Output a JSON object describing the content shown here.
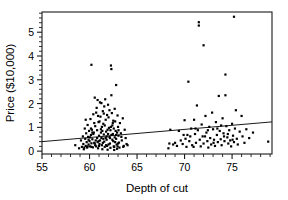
{
  "chart_data": {
    "type": "scatter",
    "title": "",
    "xlabel": "Depth of cut",
    "ylabel": "Price ($10,000)",
    "xlim": [
      55,
      79.2
    ],
    "ylim": [
      -0.12,
      5.85
    ],
    "grid": false,
    "legend": "none",
    "xticks_major": [
      55,
      60,
      65,
      70,
      75
    ],
    "xticks_major_labels": [
      "55",
      "60",
      "65",
      "70",
      "75"
    ],
    "xtick_minor_step": 1,
    "yticks_major": [
      0,
      1,
      2,
      3,
      4,
      5
    ],
    "yticks_major_labels": [
      "0",
      "1",
      "2",
      "3",
      "4",
      "5"
    ],
    "ytick_minor_step": 0.2,
    "marker": "filled-square",
    "marker_size_px": 2.2,
    "point_color": "#000000",
    "frame_color": "#1a1a1a",
    "background_color": "#ffffff",
    "trendline": {
      "present": true,
      "type": "linear",
      "x_start": 55,
      "y_start": 0.4,
      "x_end": 79.2,
      "y_end": 1.23,
      "color": "#000000"
    },
    "points": [
      [
        58.5,
        0.25
      ],
      [
        58.9,
        0.12
      ],
      [
        59.1,
        0.45
      ],
      [
        59.2,
        0.18
      ],
      [
        59.3,
        0.62
      ],
      [
        59.35,
        0.3
      ],
      [
        59.4,
        0.08
      ],
      [
        59.5,
        0.95
      ],
      [
        59.55,
        0.52
      ],
      [
        59.6,
        0.22
      ],
      [
        59.65,
        0.75
      ],
      [
        59.7,
        0.38
      ],
      [
        59.75,
        0.15
      ],
      [
        59.8,
        1.1
      ],
      [
        59.85,
        0.6
      ],
      [
        59.9,
        0.28
      ],
      [
        59.95,
        0.85
      ],
      [
        60.0,
        0.42
      ],
      [
        60.05,
        0.2
      ],
      [
        60.1,
        1.35
      ],
      [
        60.15,
        0.68
      ],
      [
        60.2,
        3.63
      ],
      [
        60.2,
        0.33
      ],
      [
        60.25,
        0.9
      ],
      [
        60.3,
        0.5
      ],
      [
        60.35,
        0.16
      ],
      [
        60.4,
        1.55
      ],
      [
        60.45,
        0.78
      ],
      [
        60.5,
        0.35
      ],
      [
        60.55,
        2.25
      ],
      [
        60.6,
        1.05
      ],
      [
        60.65,
        0.45
      ],
      [
        60.7,
        0.2
      ],
      [
        60.75,
        1.82
      ],
      [
        60.8,
        0.88
      ],
      [
        60.85,
        0.38
      ],
      [
        60.9,
        0.12
      ],
      [
        60.95,
        1.22
      ],
      [
        61.0,
        0.65
      ],
      [
        61.05,
        0.3
      ],
      [
        61.1,
        2.05
      ],
      [
        61.15,
        1.45
      ],
      [
        61.2,
        0.92
      ],
      [
        61.25,
        0.55
      ],
      [
        61.3,
        0.25
      ],
      [
        61.35,
        0.08
      ],
      [
        61.4,
        1.68
      ],
      [
        61.45,
        1.15
      ],
      [
        61.5,
        0.7
      ],
      [
        61.55,
        0.4
      ],
      [
        61.6,
        0.18
      ],
      [
        61.65,
        2.18
      ],
      [
        61.7,
        1.32
      ],
      [
        61.75,
        0.82
      ],
      [
        61.8,
        0.48
      ],
      [
        61.85,
        0.22
      ],
      [
        61.9,
        0.06
      ],
      [
        61.95,
        1.95
      ],
      [
        62.0,
        1.42
      ],
      [
        62.05,
        0.98
      ],
      [
        62.1,
        0.6
      ],
      [
        62.15,
        0.32
      ],
      [
        62.2,
        0.14
      ],
      [
        62.25,
        3.6
      ],
      [
        62.3,
        3.45
      ],
      [
        62.3,
        2.35
      ],
      [
        62.35,
        1.6
      ],
      [
        62.4,
        1.08
      ],
      [
        62.45,
        0.72
      ],
      [
        62.5,
        0.42
      ],
      [
        62.55,
        0.2
      ],
      [
        62.6,
        0.05
      ],
      [
        62.65,
        1.78
      ],
      [
        62.7,
        1.25
      ],
      [
        62.75,
        0.85
      ],
      [
        62.8,
        2.78
      ],
      [
        62.8,
        0.52
      ],
      [
        62.85,
        0.28
      ],
      [
        62.9,
        0.1
      ],
      [
        62.95,
        1.5
      ],
      [
        63.0,
        1.02
      ],
      [
        63.05,
        0.65
      ],
      [
        63.1,
        0.36
      ],
      [
        63.15,
        0.15
      ],
      [
        63.2,
        1.18
      ],
      [
        63.3,
        0.75
      ],
      [
        63.4,
        0.45
      ],
      [
        63.5,
        1.38
      ],
      [
        63.6,
        0.22
      ],
      [
        63.7,
        0.9
      ],
      [
        63.8,
        0.55
      ],
      [
        63.9,
        0.3
      ],
      [
        64.0,
        0.25
      ],
      [
        60.05,
        0.58
      ],
      [
        60.4,
        0.72
      ],
      [
        60.6,
        0.25
      ],
      [
        60.9,
        1.48
      ],
      [
        61.1,
        0.45
      ],
      [
        61.3,
        1.02
      ],
      [
        61.5,
        1.58
      ],
      [
        61.7,
        0.55
      ],
      [
        61.9,
        0.9
      ],
      [
        62.1,
        1.72
      ],
      [
        62.3,
        0.68
      ],
      [
        62.5,
        1.28
      ],
      [
        62.7,
        0.38
      ],
      [
        62.9,
        0.78
      ],
      [
        59.6,
        1.32
      ],
      [
        59.9,
        0.48
      ],
      [
        60.2,
        0.18
      ],
      [
        60.5,
        1.18
      ],
      [
        60.8,
        0.55
      ],
      [
        61.0,
        0.22
      ],
      [
        61.2,
        0.78
      ],
      [
        61.4,
        0.35
      ],
      [
        61.6,
        1.08
      ],
      [
        61.8,
        0.62
      ],
      [
        62.0,
        0.28
      ],
      [
        62.2,
        0.88
      ],
      [
        62.4,
        0.48
      ],
      [
        62.6,
        0.18
      ],
      [
        62.8,
        0.68
      ],
      [
        63.0,
        0.32
      ],
      [
        59.8,
        0.2
      ],
      [
        60.3,
        0.78
      ],
      [
        60.7,
        1.62
      ],
      [
        61.05,
        1.25
      ],
      [
        61.45,
        0.52
      ],
      [
        61.85,
        1.52
      ],
      [
        62.25,
        1.02
      ],
      [
        62.65,
        0.58
      ],
      [
        63.05,
        0.88
      ],
      [
        60.15,
        0.95
      ],
      [
        60.55,
        0.32
      ],
      [
        60.95,
        0.42
      ],
      [
        61.35,
        0.85
      ],
      [
        61.75,
        0.25
      ],
      [
        62.15,
        0.55
      ],
      [
        62.55,
        0.95
      ],
      [
        62.95,
        0.2
      ],
      [
        61.25,
        2.02
      ],
      [
        61.55,
        1.88
      ],
      [
        61.95,
        0.72
      ],
      [
        60.85,
        2.15
      ],
      [
        62.45,
        1.18
      ],
      [
        59.45,
        0.15
      ],
      [
        63.35,
        0.6
      ],
      [
        63.55,
        0.18
      ],
      [
        68.3,
        0.12
      ],
      [
        68.4,
        0.32
      ],
      [
        68.5,
        0.9
      ],
      [
        68.8,
        0.28
      ],
      [
        69.0,
        0.35
      ],
      [
        69.2,
        0.22
      ],
      [
        69.4,
        0.85
      ],
      [
        69.6,
        0.45
      ],
      [
        69.8,
        0.3
      ],
      [
        70.0,
        1.3
      ],
      [
        70.1,
        0.52
      ],
      [
        70.2,
        0.18
      ],
      [
        70.3,
        0.68
      ],
      [
        70.4,
        2.92
      ],
      [
        70.5,
        0.42
      ],
      [
        70.7,
        0.95
      ],
      [
        70.8,
        0.25
      ],
      [
        71.0,
        1.32
      ],
      [
        71.1,
        0.72
      ],
      [
        71.2,
        0.35
      ],
      [
        71.3,
        1.92
      ],
      [
        71.4,
        0.88
      ],
      [
        71.5,
        5.42
      ],
      [
        71.5,
        5.28
      ],
      [
        71.6,
        0.48
      ],
      [
        71.7,
        0.2
      ],
      [
        71.8,
        1.12
      ],
      [
        71.9,
        0.62
      ],
      [
        72.0,
        4.45
      ],
      [
        72.0,
        0.32
      ],
      [
        72.2,
        1.48
      ],
      [
        72.3,
        0.78
      ],
      [
        72.4,
        0.42
      ],
      [
        72.5,
        0.15
      ],
      [
        72.6,
        1.02
      ],
      [
        72.7,
        0.55
      ],
      [
        72.8,
        0.28
      ],
      [
        72.9,
        1.62
      ],
      [
        73.0,
        0.92
      ],
      [
        73.1,
        0.48
      ],
      [
        73.2,
        0.22
      ],
      [
        73.3,
        1.22
      ],
      [
        73.4,
        0.68
      ],
      [
        73.5,
        0.38
      ],
      [
        73.6,
        2.32
      ],
      [
        73.7,
        0.85
      ],
      [
        73.8,
        0.5
      ],
      [
        73.9,
        0.25
      ],
      [
        74.0,
        1.38
      ],
      [
        74.1,
        0.75
      ],
      [
        74.2,
        0.42
      ],
      [
        74.3,
        3.22
      ],
      [
        74.3,
        2.35
      ],
      [
        74.4,
        1.05
      ],
      [
        74.5,
        0.58
      ],
      [
        74.6,
        0.32
      ],
      [
        74.7,
        0.88
      ],
      [
        74.8,
        0.45
      ],
      [
        74.9,
        0.2
      ],
      [
        75.0,
        1.15
      ],
      [
        75.1,
        0.65
      ],
      [
        75.2,
        5.65
      ],
      [
        75.2,
        0.38
      ],
      [
        75.3,
        0.95
      ],
      [
        75.4,
        1.72
      ],
      [
        75.5,
        0.52
      ],
      [
        75.6,
        0.28
      ],
      [
        75.8,
        0.82
      ],
      [
        76.0,
        1.48
      ],
      [
        76.1,
        0.62
      ],
      [
        76.3,
        0.35
      ],
      [
        76.5,
        0.92
      ],
      [
        76.8,
        0.55
      ],
      [
        77.2,
        0.78
      ],
      [
        78.8,
        0.4
      ],
      [
        70.6,
        0.62
      ],
      [
        71.15,
        0.95
      ],
      [
        72.15,
        0.62
      ],
      [
        73.05,
        0.35
      ],
      [
        73.85,
        1.08
      ],
      [
        74.55,
        0.72
      ],
      [
        75.05,
        0.48
      ],
      [
        69.9,
        0.68
      ],
      [
        70.95,
        0.18
      ],
      [
        72.45,
        0.88
      ],
      [
        73.45,
        0.95
      ],
      [
        74.15,
        0.62
      ]
    ]
  }
}
